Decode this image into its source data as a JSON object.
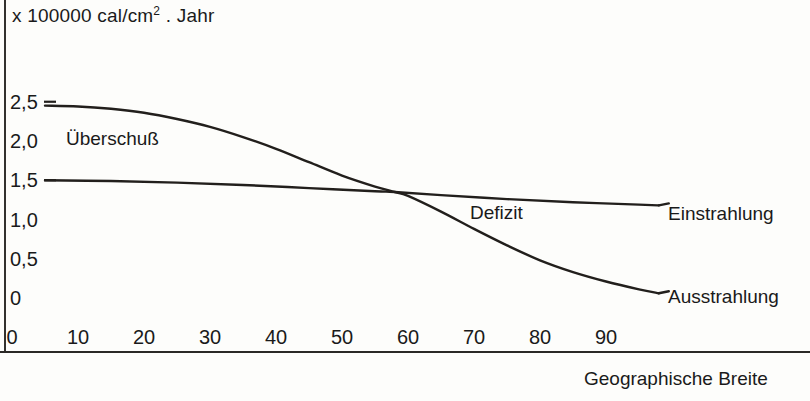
{
  "chart_data": {
    "type": "line",
    "title": "x 100000 cal/cm2 . Jahr",
    "title_prefix": "x 100000 cal/cm",
    "title_exponent": "2",
    "title_suffix": ". Jahr",
    "xlabel": "Geographische Breite",
    "ylabel": "",
    "xlim": [
      0,
      100
    ],
    "ylim": [
      0,
      2.75
    ],
    "grid": false,
    "legend_position": "inline-right",
    "x_ticks": [
      "0",
      "10",
      "20",
      "30",
      "40",
      "50",
      "60",
      "70",
      "80",
      "90"
    ],
    "x_tick_values": [
      0,
      10,
      20,
      30,
      40,
      50,
      60,
      70,
      80,
      90
    ],
    "y_ticks": [
      "0",
      "0,5",
      "1,0",
      "1,5",
      "2,0",
      "2,5"
    ],
    "y_tick_values": [
      0,
      0.5,
      1.0,
      1.5,
      2.0,
      2.5
    ],
    "series": [
      {
        "name": "Einstrahlung",
        "x": [
          5,
          10,
          15,
          20,
          25,
          30,
          35,
          40,
          45,
          50,
          55,
          58,
          60,
          65,
          70,
          75,
          80,
          85,
          90,
          95,
          98
        ],
        "values": [
          2.45,
          2.44,
          2.41,
          2.36,
          2.28,
          2.18,
          2.05,
          1.9,
          1.73,
          1.56,
          1.42,
          1.35,
          1.3,
          1.1,
          0.88,
          0.67,
          0.48,
          0.33,
          0.21,
          0.11,
          0.06
        ]
      },
      {
        "name": "Ausstrahlung",
        "x": [
          5,
          15,
          25,
          35,
          45,
          55,
          58,
          65,
          75,
          85,
          95,
          98
        ],
        "values": [
          1.5,
          1.49,
          1.47,
          1.44,
          1.4,
          1.36,
          1.35,
          1.31,
          1.26,
          1.22,
          1.19,
          1.18
        ]
      }
    ],
    "annotations": [
      {
        "text": "Überschuß",
        "x": 8,
        "y": 1.95
      },
      {
        "text": "Defizit",
        "x": 70,
        "y": 1.0
      }
    ]
  },
  "labels": {
    "ueberschuss": "Überschuß",
    "defizit": "Defizit",
    "einstrahlung": "Einstrahlung",
    "ausstrahlung": "Ausstrahlung"
  },
  "colors": {
    "curve": "#221f1c",
    "text": "#1a1a1a",
    "background": "#fdfdfb"
  }
}
